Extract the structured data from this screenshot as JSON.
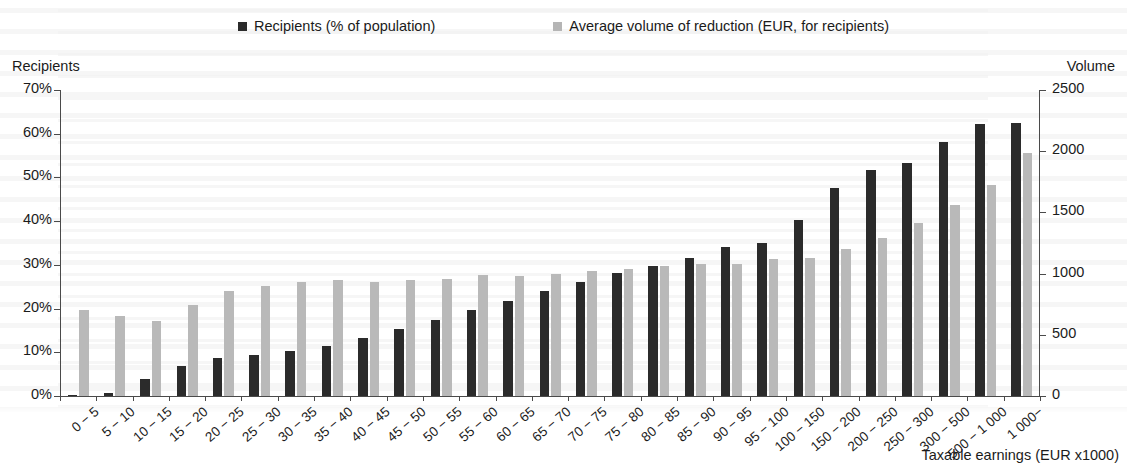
{
  "legend": {
    "items": [
      {
        "label": "Recipients (% of population)",
        "color": "#2b2b2b",
        "icon": "square-swatch-dark"
      },
      {
        "label": "Average volume of reduction (EUR, for recipients)",
        "color": "#b5b5b5",
        "icon": "square-swatch-gray"
      }
    ]
  },
  "axes": {
    "left_title": "Recipients",
    "right_title": "Volume",
    "x_title": "Taxable earnings (EUR x1000)",
    "left_ticks": [
      "0%",
      "10%",
      "20%",
      "30%",
      "40%",
      "50%",
      "60%",
      "70%"
    ],
    "right_ticks": [
      "0",
      "500",
      "1000",
      "1500",
      "2000",
      "2500"
    ]
  },
  "chart_data": {
    "type": "bar",
    "title": "",
    "subtitle": "",
    "xlabel": "Taxable earnings (EUR x1000)",
    "ylabel": "Recipients",
    "y2label": "Volume",
    "ylim": [
      0,
      70
    ],
    "y2lim": [
      0,
      2500
    ],
    "ytick_labels": [
      "0%",
      "10%",
      "20%",
      "30%",
      "40%",
      "50%",
      "60%",
      "70%"
    ],
    "y2tick_labels": [
      "0",
      "500",
      "1000",
      "1500",
      "2000",
      "2500"
    ],
    "grid": false,
    "legend_position": "top",
    "categories": [
      "0 − 5",
      "5 − 10",
      "10 − 15",
      "15 − 20",
      "20 − 25",
      "25 − 30",
      "30 − 35",
      "35 − 40",
      "40 − 45",
      "45 − 50",
      "50 − 55",
      "55 − 60",
      "60 − 65",
      "65 − 70",
      "70 − 75",
      "75 − 80",
      "80 − 85",
      "85 − 90",
      "90 − 95",
      "95 − 100",
      "100 − 150",
      "150 − 200",
      "200 − 250",
      "250 − 300",
      "300 − 500",
      "500 − 1 000",
      "1 000−"
    ],
    "series": [
      {
        "name": "Recipients (% of population)",
        "axis": "left",
        "unit": "%",
        "color": "#2b2b2b",
        "values": [
          0.2,
          0.7,
          3.8,
          6.9,
          8.8,
          9.4,
          10.4,
          11.5,
          13.2,
          15.3,
          17.4,
          19.6,
          21.8,
          24.1,
          26.1,
          28.2,
          29.8,
          31.6,
          34.2,
          34.9,
          40.3,
          47.6,
          51.6,
          53.2,
          58.2,
          62.2,
          62.4
        ]
      },
      {
        "name": "Average volume of reduction (EUR, for recipients)",
        "axis": "right",
        "unit": "EUR",
        "color": "#b9b9b9",
        "values": [
          700,
          650,
          610,
          740,
          855,
          900,
          930,
          945,
          930,
          950,
          955,
          985,
          980,
          1000,
          1020,
          1040,
          1060,
          1075,
          1080,
          1120,
          1125,
          1200,
          1290,
          1410,
          1560,
          1720,
          1985
        ]
      }
    ]
  }
}
